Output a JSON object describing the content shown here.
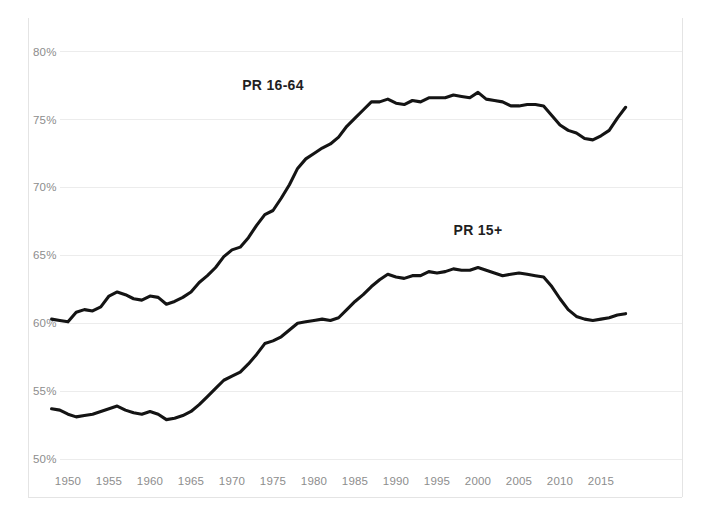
{
  "chart_data": {
    "type": "line",
    "title": "",
    "subtitle": "",
    "xlabel": "",
    "ylabel": "",
    "xlim": [
      1948,
      2019
    ],
    "ylim": [
      50,
      80
    ],
    "grid": true,
    "legend_position": "inline-labels",
    "x_ticks": [
      "1950",
      "1955",
      "1960",
      "1965",
      "1970",
      "1975",
      "1980",
      "1985",
      "1990",
      "1995",
      "2000",
      "2005",
      "2010",
      "2015"
    ],
    "x_tick_values": [
      1950,
      1955,
      1960,
      1965,
      1970,
      1975,
      1980,
      1985,
      1990,
      1995,
      2000,
      2005,
      2010,
      2015
    ],
    "y_ticks": [
      "50%",
      "55%",
      "60%",
      "65%",
      "70%",
      "75%",
      "80%"
    ],
    "y_tick_values": [
      50,
      55,
      60,
      65,
      70,
      75,
      80
    ],
    "line_color": "#141414",
    "grid_color": "#ececec",
    "tick_color": "#8d8d8d",
    "x": [
      1948,
      1949,
      1950,
      1951,
      1952,
      1953,
      1954,
      1955,
      1956,
      1957,
      1958,
      1959,
      1960,
      1961,
      1962,
      1963,
      1964,
      1965,
      1966,
      1967,
      1968,
      1969,
      1970,
      1971,
      1972,
      1973,
      1974,
      1975,
      1976,
      1977,
      1978,
      1979,
      1980,
      1981,
      1982,
      1983,
      1984,
      1985,
      1986,
      1987,
      1988,
      1989,
      1990,
      1991,
      1992,
      1993,
      1994,
      1995,
      1996,
      1997,
      1998,
      1999,
      2000,
      2001,
      2002,
      2003,
      2004,
      2005,
      2006,
      2007,
      2008,
      2009,
      2010,
      2011,
      2012,
      2013,
      2014,
      2015,
      2016,
      2017,
      2018
    ],
    "series": [
      {
        "name": "PR 16-64",
        "label": "PR 16-64",
        "label_x": 1975,
        "label_y": 77.2,
        "values": [
          60.3,
          60.2,
          60.1,
          60.8,
          61.0,
          60.9,
          61.2,
          62.0,
          62.3,
          62.1,
          61.8,
          61.7,
          62.0,
          61.9,
          61.4,
          61.6,
          61.9,
          62.3,
          63.0,
          63.5,
          64.1,
          64.9,
          65.4,
          65.6,
          66.3,
          67.2,
          68.0,
          68.3,
          69.2,
          70.2,
          71.4,
          72.1,
          72.5,
          72.9,
          73.2,
          73.7,
          74.5,
          75.1,
          75.7,
          76.3,
          76.3,
          76.5,
          76.2,
          76.1,
          76.4,
          76.3,
          76.6,
          76.6,
          76.6,
          76.8,
          76.7,
          76.6,
          77.0,
          76.5,
          76.4,
          76.3,
          76.0,
          76.0,
          76.1,
          76.1,
          76.0,
          75.3,
          74.6,
          74.2,
          74.0,
          73.6,
          73.5,
          73.8,
          74.2,
          75.1,
          75.9
        ]
      },
      {
        "name": "PR 15+",
        "label": "PR 15+",
        "label_x": 2000,
        "label_y": 66.5,
        "values": [
          53.7,
          53.6,
          53.3,
          53.1,
          53.2,
          53.3,
          53.5,
          53.7,
          53.9,
          53.6,
          53.4,
          53.3,
          53.5,
          53.3,
          52.9,
          53.0,
          53.2,
          53.5,
          54.0,
          54.6,
          55.2,
          55.8,
          56.1,
          56.4,
          57.0,
          57.7,
          58.5,
          58.7,
          59.0,
          59.5,
          60.0,
          60.1,
          60.2,
          60.3,
          60.2,
          60.4,
          61.0,
          61.6,
          62.1,
          62.7,
          63.2,
          63.6,
          63.4,
          63.3,
          63.5,
          63.5,
          63.8,
          63.7,
          63.8,
          64.0,
          63.9,
          63.9,
          64.1,
          63.9,
          63.7,
          63.5,
          63.6,
          63.7,
          63.6,
          63.5,
          63.4,
          62.7,
          61.8,
          61.0,
          60.5,
          60.3,
          60.2,
          60.3,
          60.4,
          60.6,
          60.7
        ]
      }
    ]
  }
}
